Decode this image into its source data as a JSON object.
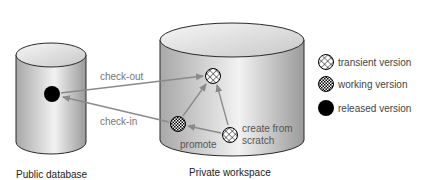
{
  "diagram": {
    "containers": [
      {
        "id": "public",
        "caption": "Public database"
      },
      {
        "id": "private",
        "caption": "Private workspace"
      }
    ],
    "nodes": [
      {
        "id": "released",
        "type": "released"
      },
      {
        "id": "transient_top",
        "type": "transient"
      },
      {
        "id": "working",
        "type": "working",
        "label": "promote"
      },
      {
        "id": "transient_scratch",
        "type": "transient",
        "label_lines": [
          "create from",
          "scratch"
        ]
      }
    ],
    "edges": [
      {
        "from": "released",
        "to": "transient_top",
        "label": "check-out"
      },
      {
        "from": "working",
        "to": "released",
        "label": "check-in"
      },
      {
        "from": "working",
        "to": "transient_top"
      },
      {
        "from": "transient_scratch",
        "to": "transient_top"
      },
      {
        "from": "transient_scratch",
        "to": "working"
      }
    ],
    "labels": {
      "checkout": "check-out",
      "checkin": "check-in",
      "promote": "promote",
      "scratch_line1": "create from",
      "scratch_line2": "scratch",
      "public_caption": "Public database",
      "private_caption": "Private workspace"
    },
    "legend": [
      {
        "type": "transient",
        "label": "transient version"
      },
      {
        "type": "working",
        "label": "working version"
      },
      {
        "type": "released",
        "label": "released version"
      }
    ],
    "colors": {
      "arrow": "#8a8a8a",
      "released": "#000000",
      "cylinder_outline": "#2a2a2a"
    }
  }
}
